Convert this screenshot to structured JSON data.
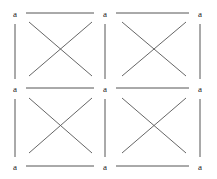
{
  "figure": {
    "type": "lattice-diagram",
    "width": 217,
    "height": 179,
    "background_color": "#ffffff",
    "line_color": "#555555",
    "diagonal_color": "#555555",
    "label_color": "#1a1a1a",
    "edge_stroke_width": 1,
    "diagonal_stroke_width": 0.9
  },
  "grid": {
    "columns": 3,
    "rows": 3,
    "cells": 4,
    "node_x": [
      15,
      105,
      200
    ],
    "node_y": [
      14,
      89,
      167
    ]
  },
  "labels": {
    "text": "a",
    "nodes": [
      {
        "id": "node-r0-c0",
        "text": "a",
        "x": 15,
        "y": 14
      },
      {
        "id": "node-r0-c1",
        "text": "a",
        "x": 105,
        "y": 14
      },
      {
        "id": "node-r0-c2",
        "text": "a",
        "x": 200,
        "y": 14
      },
      {
        "id": "node-r1-c0",
        "text": "a",
        "x": 15,
        "y": 89
      },
      {
        "id": "node-r1-c1",
        "text": "a",
        "x": 105,
        "y": 89
      },
      {
        "id": "node-r1-c2",
        "text": "a",
        "x": 200,
        "y": 89
      },
      {
        "id": "node-r2-c0",
        "text": "a",
        "x": 15,
        "y": 167
      },
      {
        "id": "node-r2-c1",
        "text": "a",
        "x": 105,
        "y": 167
      },
      {
        "id": "node-r2-c2",
        "text": "a",
        "x": 200,
        "y": 167
      }
    ]
  },
  "edges": {
    "horizontal": [
      {
        "id": "edge-h-r0-c0",
        "x1": 26,
        "y1": 13,
        "x2": 94,
        "y2": 13
      },
      {
        "id": "edge-h-r0-c1",
        "x1": 116,
        "y1": 13,
        "x2": 189,
        "y2": 13
      },
      {
        "id": "edge-h-r1-c0",
        "x1": 26,
        "y1": 88,
        "x2": 94,
        "y2": 88
      },
      {
        "id": "edge-h-r1-c1",
        "x1": 116,
        "y1": 88,
        "x2": 189,
        "y2": 88
      },
      {
        "id": "edge-h-r2-c0",
        "x1": 26,
        "y1": 166,
        "x2": 94,
        "y2": 166
      },
      {
        "id": "edge-h-r2-c1",
        "x1": 116,
        "y1": 166,
        "x2": 189,
        "y2": 166
      }
    ],
    "vertical": [
      {
        "id": "edge-v-c0-r0",
        "x1": 15,
        "y1": 24,
        "x2": 15,
        "y2": 79
      },
      {
        "id": "edge-v-c1-r0",
        "x1": 105,
        "y1": 24,
        "x2": 105,
        "y2": 79
      },
      {
        "id": "edge-v-c2-r0",
        "x1": 200,
        "y1": 24,
        "x2": 200,
        "y2": 79
      },
      {
        "id": "edge-v-c0-r1",
        "x1": 15,
        "y1": 99,
        "x2": 15,
        "y2": 157
      },
      {
        "id": "edge-v-c1-r1",
        "x1": 105,
        "y1": 99,
        "x2": 105,
        "y2": 157
      },
      {
        "id": "edge-v-c2-r1",
        "x1": 200,
        "y1": 99,
        "x2": 200,
        "y2": 157
      }
    ]
  },
  "diagonals": {
    "cells": [
      {
        "id": "cell-r0-c0",
        "down": {
          "x1": 29,
          "y1": 22,
          "x2": 92,
          "y2": 76
        },
        "up": {
          "x1": 29,
          "y1": 76,
          "x2": 92,
          "y2": 22
        }
      },
      {
        "id": "cell-r0-c1",
        "down": {
          "x1": 122,
          "y1": 22,
          "x2": 186,
          "y2": 76
        },
        "up": {
          "x1": 122,
          "y1": 76,
          "x2": 186,
          "y2": 22
        }
      },
      {
        "id": "cell-r1-c0",
        "down": {
          "x1": 29,
          "y1": 98,
          "x2": 92,
          "y2": 153
        },
        "up": {
          "x1": 29,
          "y1": 153,
          "x2": 92,
          "y2": 98
        }
      },
      {
        "id": "cell-r1-c1",
        "down": {
          "x1": 122,
          "y1": 98,
          "x2": 186,
          "y2": 153
        },
        "up": {
          "x1": 122,
          "y1": 153,
          "x2": 186,
          "y2": 98
        }
      }
    ]
  }
}
